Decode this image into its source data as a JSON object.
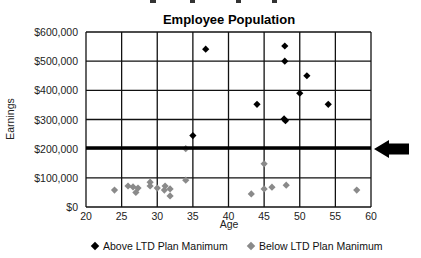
{
  "chart_data": {
    "type": "scatter",
    "title": "Employee Population",
    "xlabel": "Age",
    "ylabel": "Earnings",
    "xlim": [
      20,
      60
    ],
    "ylim": [
      0,
      600000
    ],
    "x_ticks": [
      "20",
      "25",
      "30",
      "35",
      "40",
      "45",
      "50",
      "55",
      "60"
    ],
    "y_ticks": [
      "$0",
      "$100,000",
      "$200,000",
      "$300,000",
      "$400,000",
      "$500,000",
      "$600,000"
    ],
    "grid": true,
    "threshold_line": {
      "y": 200000,
      "annotation": "arrow pointing left at threshold"
    },
    "legend_position": "bottom",
    "series": [
      {
        "name": "Above LTD Plan Manimum",
        "color": "#000000",
        "marker": "diamond",
        "points": [
          {
            "x": 35,
            "y": 245000
          },
          {
            "x": 36.8,
            "y": 541000
          },
          {
            "x": 44,
            "y": 352000
          },
          {
            "x": 47.9,
            "y": 552000
          },
          {
            "x": 47.9,
            "y": 500000
          },
          {
            "x": 47.8,
            "y": 302000
          },
          {
            "x": 48,
            "y": 296000
          },
          {
            "x": 50,
            "y": 390000
          },
          {
            "x": 51,
            "y": 450000
          },
          {
            "x": 54,
            "y": 352000
          }
        ]
      },
      {
        "name": "Below LTD Plan Manimum",
        "color": "#8a8a8a",
        "marker": "diamond",
        "points": [
          {
            "x": 24,
            "y": 58000
          },
          {
            "x": 25.9,
            "y": 72000
          },
          {
            "x": 26.6,
            "y": 69000
          },
          {
            "x": 27,
            "y": 50000
          },
          {
            "x": 27.3,
            "y": 65000
          },
          {
            "x": 29,
            "y": 85000
          },
          {
            "x": 29,
            "y": 72000
          },
          {
            "x": 30,
            "y": 65000
          },
          {
            "x": 31.1,
            "y": 72000
          },
          {
            "x": 31,
            "y": 58000
          },
          {
            "x": 31.8,
            "y": 62000
          },
          {
            "x": 31.8,
            "y": 38000
          },
          {
            "x": 34,
            "y": 200000
          },
          {
            "x": 34,
            "y": 92000
          },
          {
            "x": 43.2,
            "y": 45000
          },
          {
            "x": 45,
            "y": 148000
          },
          {
            "x": 45,
            "y": 62000
          },
          {
            "x": 46.1,
            "y": 68000
          },
          {
            "x": 48.1,
            "y": 75000
          },
          {
            "x": 58,
            "y": 58000
          }
        ]
      }
    ]
  },
  "legend": {
    "above_label": "Above LTD Plan Manimum",
    "below_label": "Below LTD Plan Manimum"
  }
}
